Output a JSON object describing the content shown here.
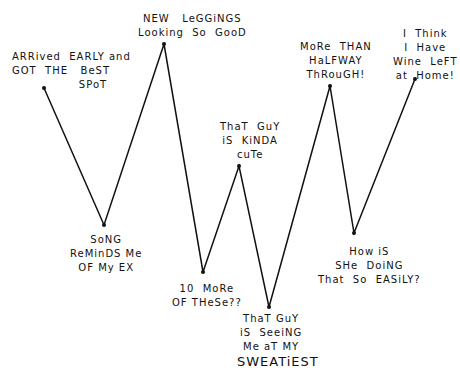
{
  "chart_data": {
    "type": "line",
    "title": "",
    "xlabel": "",
    "ylabel": "",
    "grid": false,
    "legend": "none",
    "line_color": "#111111",
    "points": [
      {
        "x": 44,
        "y": 88,
        "label": "ARRived EARLY and\nGOT THE BeST\nSPoT"
      },
      {
        "x": 104,
        "y": 225,
        "label": "SoNG\nReMinDS Me\nOF My EX"
      },
      {
        "x": 164,
        "y": 44,
        "label": "NEW  LeGGiNGS\nLooking  So  GooD"
      },
      {
        "x": 203,
        "y": 272,
        "label": "10  MoRe\nOF THeSe??"
      },
      {
        "x": 239,
        "y": 166,
        "label": "ThaT  GuY\niS  KiNDA\ncuTe"
      },
      {
        "x": 269,
        "y": 307,
        "label": "ThaT GuY\niS  SeeiNG\nMe aT MY\nSWEATiEST"
      },
      {
        "x": 330,
        "y": 86,
        "label": "MoRe  THAN\nHaLFWAY\nThRouGH!"
      },
      {
        "x": 354,
        "y": 233,
        "label": "How iS\nSHe  DoiNG\nThat  So  EASiLY?"
      },
      {
        "x": 415,
        "y": 79,
        "label": "I  Think\nI  Have\nWine  LeFT\nat  Home!"
      }
    ]
  },
  "labels": {
    "p1": "ARRived  EARLY and\nGOT  THE   BeST\n                SPoT",
    "p2": "SoNG\nReMinDS Me\nOF My EX",
    "p3": "NEW   LeGGiNGS\nLooking  So  GooD",
    "p4": "10  MoRe\nOF THeSe??",
    "p5": "ThaT  GuY\niS  KiNDA\ncuTe",
    "p6a": "ThaT GuY\niS  SeeiNG\nMe aT MY",
    "p6b": "SWEATiEST",
    "p7": "MoRe  THAN\nHaLFWAY\nThRouGH!",
    "p8": "How iS\nSHe  DoiNG\nThat  So  EASiLY?",
    "p9": "I  Think\nI  Have\nWine  LeFT\nat  Home!"
  }
}
